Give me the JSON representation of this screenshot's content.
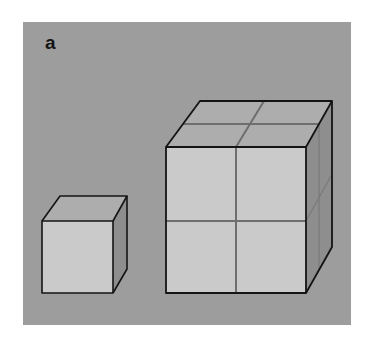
{
  "figure": {
    "panel_label": "a",
    "colors": {
      "background": "#9d9d9d",
      "front_face": "#cacaca",
      "top_face": "#adadad",
      "side_face": "#8e8e8e",
      "edge": "#141414",
      "divider": "#6e6e6e"
    }
  }
}
